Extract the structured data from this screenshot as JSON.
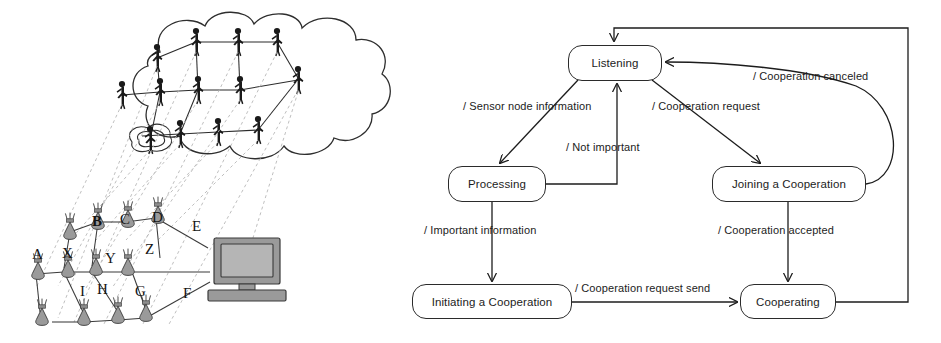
{
  "figure": {
    "width": 941,
    "height": 343,
    "background": "#ffffff",
    "ink": "#1c1c1c"
  },
  "left_panel": {
    "name": "sensor-network-overlay-illustration",
    "description": "Cloud of networked person icons above a grid of sensor nodes connected to a desktop computer, with dashed projection lines mapping each person to a sensor node",
    "cloud": {
      "person_count": 13,
      "person_color": "#1a1a1a"
    },
    "sensor_nodes": {
      "fill": "#9a9a9a",
      "stroke": "#3a3a3a",
      "rows": [
        {
          "row": "top",
          "labels": [
            "B",
            "C",
            "D",
            "E"
          ],
          "bold": [
            "B"
          ]
        },
        {
          "row": "middle",
          "labels": [
            "A",
            "X",
            "Y",
            "Z"
          ],
          "bold": []
        },
        {
          "row": "bottom",
          "labels": [
            "I",
            "H",
            "G",
            "F"
          ],
          "bold": []
        }
      ]
    },
    "workstation": {
      "name": "desktop-computer",
      "fill": "#9a9a9a",
      "stroke": "#3a3a3a"
    }
  },
  "right_panel": {
    "name": "cooperation-state-diagram",
    "type": "state-machine",
    "states": [
      {
        "id": "listening",
        "label": "Listening",
        "x": 568,
        "y": 45,
        "w": 94,
        "h": 36
      },
      {
        "id": "processing",
        "label": "Processing",
        "x": 448,
        "y": 166,
        "w": 98,
        "h": 36
      },
      {
        "id": "joining",
        "label": "Joining a Cooperation",
        "x": 712,
        "y": 166,
        "w": 154,
        "h": 36
      },
      {
        "id": "initiating",
        "label": "Initiating a Cooperation",
        "x": 412,
        "y": 284,
        "w": 160,
        "h": 35
      },
      {
        "id": "cooperating",
        "label": "Cooperating",
        "x": 740,
        "y": 284,
        "w": 96,
        "h": 35
      }
    ],
    "transitions": [
      {
        "id": "t-sensor",
        "from": "listening",
        "to": "processing",
        "label": "/ Sensor node information",
        "lx": 463,
        "ly": 100
      },
      {
        "id": "t-notimp",
        "from": "processing",
        "to": "listening",
        "label": "/ Not important",
        "lx": 566,
        "ly": 141
      },
      {
        "id": "t-request",
        "from": "listening",
        "to": "joining",
        "label": "/ Cooperation request",
        "lx": 652,
        "ly": 100
      },
      {
        "id": "t-canceled",
        "from": "joining",
        "to": "listening",
        "label": "/ Cooperation canceled",
        "lx": 753,
        "ly": 70
      },
      {
        "id": "t-important",
        "from": "processing",
        "to": "initiating",
        "label": "/ Important information",
        "lx": 424,
        "ly": 224
      },
      {
        "id": "t-accepted",
        "from": "joining",
        "to": "cooperating",
        "label": "/ Cooperation accepted",
        "lx": 718,
        "ly": 224
      },
      {
        "id": "t-reqsend",
        "from": "initiating",
        "to": "cooperating",
        "label": "/ Cooperation request send",
        "lx": 575,
        "ly": 282
      },
      {
        "id": "t-return",
        "from": "cooperating",
        "to": "listening",
        "label": "",
        "lx": 0,
        "ly": 0
      }
    ]
  }
}
